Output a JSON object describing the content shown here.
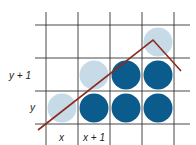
{
  "diagram": {
    "grid": {
      "h_lines_y": [
        25,
        58,
        91,
        124
      ],
      "v_lines_x": [
        46,
        78,
        110,
        142,
        174
      ],
      "h_extent": [
        35,
        190
      ],
      "v_extent": [
        12,
        145
      ],
      "color": "#333333"
    },
    "circles": [
      {
        "cx": 62,
        "cy": 108,
        "shade": "light"
      },
      {
        "cx": 94,
        "cy": 75,
        "shade": "light"
      },
      {
        "cx": 158,
        "cy": 42,
        "shade": "light"
      },
      {
        "cx": 94,
        "cy": 108,
        "shade": "dark"
      },
      {
        "cx": 126,
        "cy": 108,
        "shade": "dark"
      },
      {
        "cx": 158,
        "cy": 108,
        "shade": "dark"
      },
      {
        "cx": 126,
        "cy": 75,
        "shade": "dark"
      },
      {
        "cx": 158,
        "cy": 75,
        "shade": "dark"
      }
    ],
    "circle_radius": 14.5,
    "colors": {
      "light": "#c6dbe7",
      "dark": "#0b5b8c",
      "line": "#8c2b1e"
    },
    "polyline": [
      [
        38,
        130
      ],
      [
        153,
        40
      ],
      [
        181,
        71
      ]
    ],
    "labels": {
      "y_plus_1": "y + 1",
      "y": "y",
      "x": "x",
      "x_plus_1": "x + 1"
    }
  }
}
